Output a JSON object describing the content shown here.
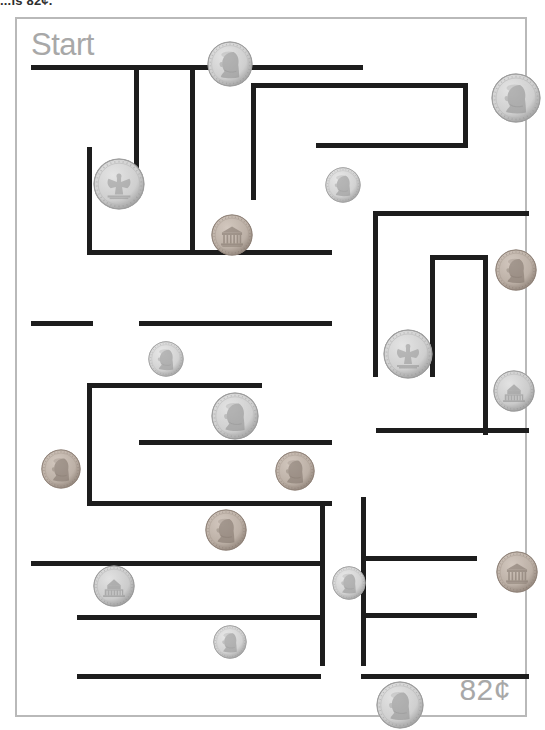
{
  "instruction": {
    "text": "...is 82¢."
  },
  "worksheet": {
    "start_label": "Start",
    "total_label": "82¢",
    "accent_text_color": "#a8a8a8",
    "wall_color": "#1d1d1d",
    "page_border_color": "#b9b9b9",
    "silver_color": "#c9c9c9",
    "copper_color": "#b0a095"
  },
  "maze": {
    "walls": [
      {
        "name": "outer-top-partial",
        "x": 14,
        "y": 46,
        "w": 332,
        "h": 5
      },
      {
        "name": "wall-v-1",
        "x": 117,
        "y": 46,
        "w": 5,
        "h": 126
      },
      {
        "name": "wall-v-2",
        "x": 173,
        "y": 46,
        "w": 5,
        "h": 186
      },
      {
        "name": "wall-v-3",
        "x": 70,
        "y": 128,
        "w": 5,
        "h": 108
      },
      {
        "name": "wall-h-4",
        "x": 70,
        "y": 231,
        "w": 245,
        "h": 5
      },
      {
        "name": "wall-h-top-right",
        "x": 234,
        "y": 64,
        "w": 217,
        "h": 5
      },
      {
        "name": "wall-v-right-1",
        "x": 234,
        "y": 64,
        "w": 5,
        "h": 117
      },
      {
        "name": "wall-v-right-2",
        "x": 446,
        "y": 64,
        "w": 5,
        "h": 64
      },
      {
        "name": "wall-h-right-2",
        "x": 299,
        "y": 124,
        "w": 152,
        "h": 5
      },
      {
        "name": "wall-h-mid-right",
        "x": 356,
        "y": 192,
        "w": 156,
        "h": 5
      },
      {
        "name": "wall-v-mid-right",
        "x": 356,
        "y": 192,
        "w": 5,
        "h": 166
      },
      {
        "name": "wall-v-inner-box-l",
        "x": 413,
        "y": 236,
        "w": 5,
        "h": 122
      },
      {
        "name": "wall-h-inner-box-t",
        "x": 413,
        "y": 236,
        "w": 57,
        "h": 5
      },
      {
        "name": "wall-v-inner-box-r",
        "x": 466,
        "y": 236,
        "w": 5,
        "h": 180
      },
      {
        "name": "wall-h-left-1",
        "x": 14,
        "y": 302,
        "w": 62,
        "h": 5
      },
      {
        "name": "wall-h-left-2",
        "x": 122,
        "y": 302,
        "w": 193,
        "h": 5
      },
      {
        "name": "wall-v-mid-left",
        "x": 70,
        "y": 364,
        "w": 5,
        "h": 122
      },
      {
        "name": "wall-h-mid-left-t",
        "x": 70,
        "y": 364,
        "w": 175,
        "h": 5
      },
      {
        "name": "wall-h-mid-left-b",
        "x": 70,
        "y": 482,
        "w": 245,
        "h": 5
      },
      {
        "name": "wall-h-mid-center",
        "x": 122,
        "y": 421,
        "w": 193,
        "h": 5
      },
      {
        "name": "wall-h-right-3",
        "x": 359,
        "y": 409,
        "w": 153,
        "h": 5
      },
      {
        "name": "wall-h-long-bottom",
        "x": 14,
        "y": 542,
        "w": 290,
        "h": 5
      },
      {
        "name": "wall-v-bottom-1",
        "x": 303,
        "y": 487,
        "w": 5,
        "h": 160
      },
      {
        "name": "wall-v-bottom-2",
        "x": 344,
        "y": 478,
        "w": 5,
        "h": 169
      },
      {
        "name": "wall-h-bottom-right-1",
        "x": 344,
        "y": 537,
        "w": 116,
        "h": 5
      },
      {
        "name": "wall-h-bottom-right-2",
        "x": 344,
        "y": 594,
        "w": 116,
        "h": 5
      },
      {
        "name": "wall-h-bottom-left-1",
        "x": 60,
        "y": 596,
        "w": 248,
        "h": 5
      },
      {
        "name": "wall-h-bottom-left-2",
        "x": 60,
        "y": 655,
        "w": 244,
        "h": 5
      },
      {
        "name": "wall-h-bottom-end",
        "x": 344,
        "y": 655,
        "w": 168,
        "h": 5
      }
    ]
  },
  "coins": [
    {
      "id": "coin-1",
      "type": "quarter",
      "side": "obverse",
      "x": 190,
      "y": 22,
      "size": 46
    },
    {
      "id": "coin-2",
      "type": "quarter",
      "side": "obverse",
      "x": 474,
      "y": 54,
      "size": 50
    },
    {
      "id": "coin-3",
      "type": "quarter",
      "side": "reverse",
      "x": 76,
      "y": 139,
      "size": 52
    },
    {
      "id": "coin-4",
      "type": "dime",
      "side": "obverse",
      "x": 308,
      "y": 148,
      "size": 36
    },
    {
      "id": "coin-5",
      "type": "penny",
      "side": "reverse",
      "x": 194,
      "y": 195,
      "size": 42
    },
    {
      "id": "coin-6",
      "type": "penny",
      "side": "obverse",
      "x": 478,
      "y": 230,
      "size": 42
    },
    {
      "id": "coin-7",
      "type": "dime",
      "side": "obverse",
      "x": 131,
      "y": 322,
      "size": 36
    },
    {
      "id": "coin-8",
      "type": "quarter",
      "side": "reverse",
      "x": 366,
      "y": 310,
      "size": 50
    },
    {
      "id": "coin-9",
      "type": "quarter",
      "side": "obverse",
      "x": 194,
      "y": 373,
      "size": 48
    },
    {
      "id": "coin-10",
      "type": "nickel",
      "side": "reverse",
      "x": 476,
      "y": 351,
      "size": 42
    },
    {
      "id": "coin-11",
      "type": "penny",
      "side": "obverse",
      "x": 24,
      "y": 430,
      "size": 40
    },
    {
      "id": "coin-12",
      "type": "penny",
      "side": "obverse",
      "x": 258,
      "y": 432,
      "size": 40
    },
    {
      "id": "coin-13",
      "type": "penny",
      "side": "obverse",
      "x": 188,
      "y": 490,
      "size": 42
    },
    {
      "id": "coin-14",
      "type": "nickel",
      "side": "reverse",
      "x": 76,
      "y": 546,
      "size": 42
    },
    {
      "id": "coin-15",
      "type": "dime",
      "side": "obverse",
      "x": 315,
      "y": 547,
      "size": 34
    },
    {
      "id": "coin-16",
      "type": "penny",
      "side": "reverse",
      "x": 479,
      "y": 532,
      "size": 42
    },
    {
      "id": "coin-17",
      "type": "dime",
      "side": "obverse",
      "x": 196,
      "y": 606,
      "size": 34
    },
    {
      "id": "coin-18",
      "type": "quarter",
      "side": "obverse",
      "x": 359,
      "y": 662,
      "size": 48
    }
  ]
}
